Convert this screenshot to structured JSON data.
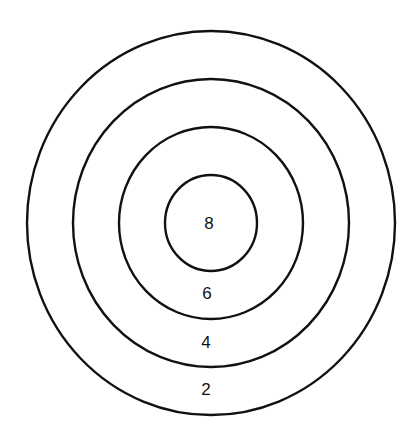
{
  "diagram": {
    "type": "concentric-target",
    "center": {
      "x": 211,
      "y": 223
    },
    "rings": [
      {
        "id": "outer",
        "rx": 184,
        "ry": 192,
        "score_label": "2",
        "label_y": 389
      },
      {
        "id": "second",
        "rx": 138,
        "ry": 144,
        "score_label": "4",
        "label_y": 342
      },
      {
        "id": "third",
        "rx": 92,
        "ry": 96,
        "score_label": "6",
        "label_y": 293
      },
      {
        "id": "bullseye",
        "rx": 46,
        "ry": 48,
        "score_label": "8",
        "label_y": 223
      }
    ],
    "labels": {
      "bullseye": "8",
      "third": "6",
      "second": "4",
      "outer": "2"
    },
    "stroke_color": "#111111",
    "background_color": "#ffffff"
  }
}
